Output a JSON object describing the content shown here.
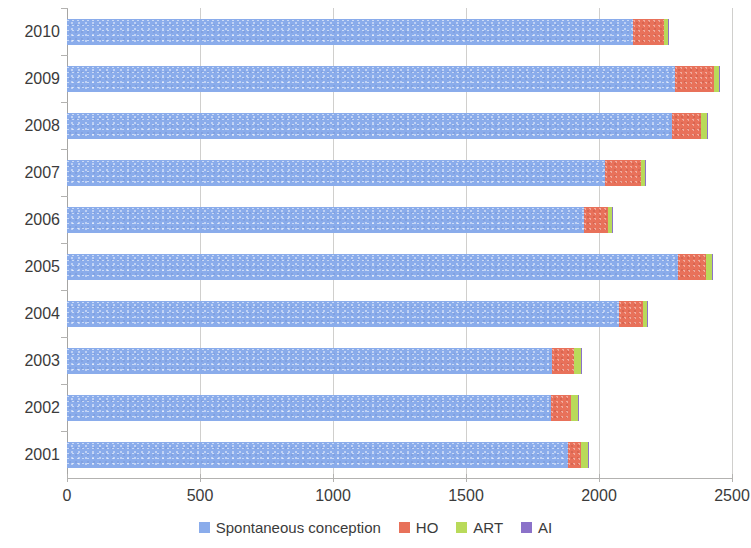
{
  "chart_data": {
    "type": "bar",
    "orientation": "horizontal",
    "stacked": true,
    "title": "",
    "xlabel": "",
    "ylabel": "",
    "xlim": [
      0,
      2500
    ],
    "xticks": [
      0,
      500,
      1000,
      1500,
      2000,
      2500
    ],
    "xtick_labels": [
      "0",
      "500",
      "1000",
      "1500",
      "2000",
      "2500"
    ],
    "grid": true,
    "grid_axis": "x",
    "legend_position": "bottom",
    "categories": [
      "2010",
      "2009",
      "2008",
      "2007",
      "2006",
      "2005",
      "2004",
      "2003",
      "2002",
      "2001"
    ],
    "series": [
      {
        "name": "Spontaneous conception",
        "color": "#8aaceb",
        "values": [
          2128,
          2286,
          2274,
          2022,
          1944,
          2297,
          2075,
          1824,
          1820,
          1883
        ]
      },
      {
        "name": "HO",
        "color": "#e8715a",
        "values": [
          116,
          146,
          109,
          136,
          90,
          105,
          90,
          82,
          74,
          49
        ]
      },
      {
        "name": "ART",
        "color": "#b9da5a",
        "values": [
          15,
          19,
          23,
          15,
          14,
          23,
          15,
          26,
          27,
          26
        ]
      },
      {
        "name": "AI",
        "color": "#8b72c9",
        "values": [
          3,
          3,
          3,
          3,
          3,
          3,
          3,
          3,
          3,
          3
        ]
      }
    ],
    "totals": [
      2262,
      2454,
      2409,
      2176,
      2051,
      2428,
      2183,
      1935,
      1924,
      1961
    ]
  },
  "legend": {
    "items": [
      {
        "label": "Spontaneous conception",
        "color": "#8aaceb"
      },
      {
        "label": "HO",
        "color": "#e8715a"
      },
      {
        "label": "ART",
        "color": "#b9da5a"
      },
      {
        "label": "AI",
        "color": "#8b72c9"
      }
    ]
  }
}
